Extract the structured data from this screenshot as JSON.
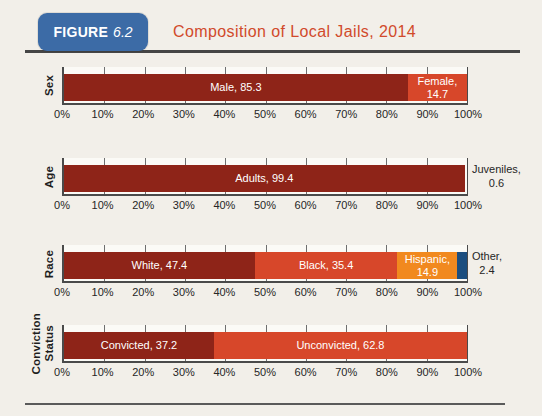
{
  "header": {
    "badge_label": "FIGURE",
    "badge_number": "6.2",
    "title": "Composition of Local Jails, 2014",
    "badge_color": "#3c6ba6",
    "title_color": "#d14a2b"
  },
  "colors": {
    "dark_red": "#8e2418",
    "red_orange": "#d7472a",
    "orange": "#f1891f",
    "navy": "#1c4e7f",
    "page_bg": "#f2efe9",
    "plot_bg": "#fbfaf6",
    "bar_label_text": "#ffffff",
    "axis_text": "#262626"
  },
  "axis": {
    "min": 0,
    "max": 100,
    "tick_step": 10,
    "tick_labels": [
      "0%",
      "10%",
      "20%",
      "30%",
      "40%",
      "50%",
      "60%",
      "70%",
      "80%",
      "90%",
      "100%"
    ]
  },
  "chart_data": [
    {
      "type": "bar",
      "orientation": "horizontal-stacked",
      "category": "Sex",
      "category_display": "Sex",
      "xlim": [
        0,
        100
      ],
      "segments": [
        {
          "name": "Male",
          "value": 85.3,
          "label": "Male, 85.3",
          "color": "#8e2418",
          "label_position": "inside"
        },
        {
          "name": "Female",
          "value": 14.7,
          "label": "Female, 14.7",
          "color": "#d7472a",
          "label_position": "inside"
        }
      ]
    },
    {
      "type": "bar",
      "orientation": "horizontal-stacked",
      "category": "Age",
      "category_display": "Age",
      "xlim": [
        0,
        100
      ],
      "segments": [
        {
          "name": "Adults",
          "value": 99.4,
          "label": "Adults, 99.4",
          "color": "#8e2418",
          "label_position": "inside"
        },
        {
          "name": "Juveniles",
          "value": 0.6,
          "label": "Juveniles, 0.6",
          "color": "none",
          "label_position": "outside"
        }
      ]
    },
    {
      "type": "bar",
      "orientation": "horizontal-stacked",
      "category": "Race",
      "category_display": "Race",
      "xlim": [
        0,
        100
      ],
      "segments": [
        {
          "name": "White",
          "value": 47.4,
          "label": "White, 47.4",
          "color": "#8e2418",
          "label_position": "inside"
        },
        {
          "name": "Black",
          "value": 35.4,
          "label": "Black, 35.4",
          "color": "#d7472a",
          "label_position": "inside"
        },
        {
          "name": "Hispanic",
          "value": 14.9,
          "label": "Hispanic, 14.9",
          "color": "#f1891f",
          "label_position": "inside"
        },
        {
          "name": "Other",
          "value": 2.4,
          "label": "Other, 2.4",
          "color": "#1c4e7f",
          "label_position": "outside"
        }
      ]
    },
    {
      "type": "bar",
      "orientation": "horizontal-stacked",
      "category": "Conviction Status",
      "category_display": "Conviction\nStatus",
      "xlim": [
        0,
        100
      ],
      "segments": [
        {
          "name": "Convicted",
          "value": 37.2,
          "label": "Convicted, 37.2",
          "color": "#8e2418",
          "label_position": "inside"
        },
        {
          "name": "Unconvicted",
          "value": 62.8,
          "label": "Unconvicted, 62.8",
          "color": "#d7472a",
          "label_position": "inside"
        }
      ]
    }
  ],
  "layout": {
    "chart_tops_px": [
      67,
      158,
      245,
      325
    ]
  }
}
